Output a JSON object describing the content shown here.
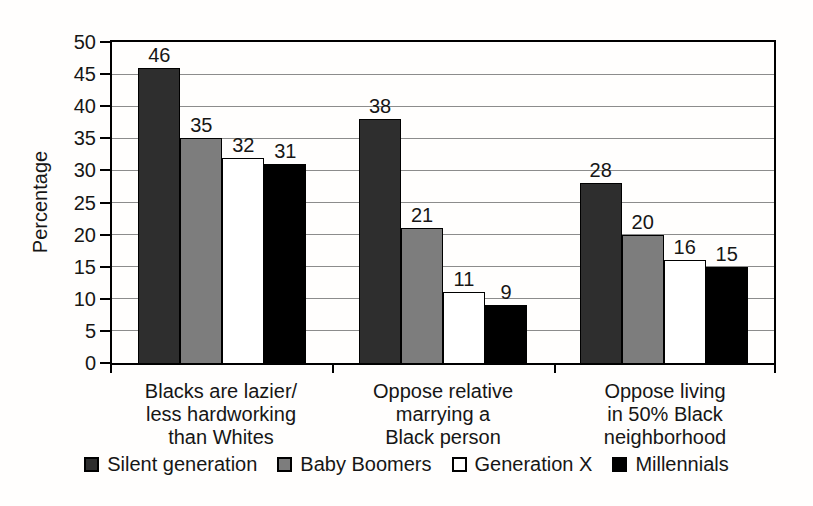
{
  "figure": {
    "background": "#fffefd",
    "text_color": "#161616",
    "axis_color": "#000000",
    "gridline_color": "#8c8c8c"
  },
  "chart_data": {
    "type": "bar",
    "title": "",
    "xlabel": "",
    "ylabel": "Percentage",
    "ylim": [
      0,
      50
    ],
    "ytick_step": 5,
    "yticks": [
      0,
      5,
      10,
      15,
      20,
      25,
      30,
      35,
      40,
      45,
      50
    ],
    "grid": true,
    "legend_position": "bottom",
    "categories": [
      [
        "Blacks are lazier/",
        "less hardworking",
        "than Whites"
      ],
      [
        "Oppose relative",
        "marrying a",
        "Black person"
      ],
      [
        "Oppose living",
        "in 50% Black",
        "neighborhood"
      ]
    ],
    "series": [
      {
        "name": "Silent generation",
        "color": "#2e2e2e",
        "textured": true,
        "values": [
          46,
          38,
          28
        ]
      },
      {
        "name": "Baby Boomers",
        "color": "#7d7d7d",
        "textured": true,
        "values": [
          35,
          21,
          20
        ]
      },
      {
        "name": "Generation X",
        "color": "#ffffff",
        "textured": false,
        "values": [
          32,
          11,
          16
        ]
      },
      {
        "name": "Millennials",
        "color": "#000000",
        "textured": false,
        "values": [
          31,
          9,
          15
        ]
      }
    ]
  }
}
